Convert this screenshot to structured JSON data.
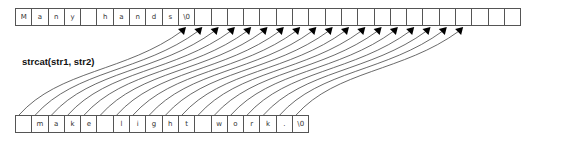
{
  "diagram": {
    "title": "strcat(str1, str2)",
    "str1": {
      "cells": [
        "M",
        "a",
        "n",
        "y",
        "",
        "h",
        "a",
        "n",
        "d",
        "s",
        "\\0",
        "",
        "",
        "",
        "",
        "",
        "",
        "",
        "",
        "",
        "",
        "",
        "",
        "",
        "",
        "",
        "",
        "",
        "",
        "",
        ""
      ]
    },
    "str2": {
      "cells": [
        "",
        "m",
        "a",
        "k",
        "e",
        "",
        "l",
        "i",
        "g",
        "h",
        "t",
        "",
        "w",
        "o",
        "r",
        "k",
        ".",
        "\\0"
      ]
    },
    "arrows": {
      "from": "str2 cells 0-17",
      "to": "str1 cells 10-27",
      "count": 18
    },
    "colors": {
      "border": "#555555",
      "text": "#333333",
      "line": "#444444",
      "arrowhead": "#000000"
    }
  }
}
